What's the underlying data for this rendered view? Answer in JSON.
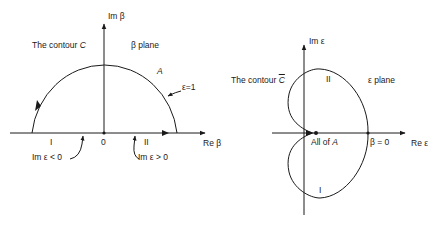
{
  "left_panel": {
    "im_axis_label": "Im β",
    "re_axis_label": "Re β",
    "contour_label_prefix": "The contour ",
    "contour_label_symbol": "C",
    "plane_label": "β plane",
    "arc_label": "A",
    "epsilon_label": "ε=1",
    "origin_label": "0",
    "region_I": "I",
    "region_II": "II",
    "im_eps_neg_label": "Im ε < 0",
    "im_eps_pos_label": "Im ε > 0"
  },
  "right_panel": {
    "im_axis_label": "Im ε",
    "re_axis_label": "Re ε",
    "contour_label_prefix": "The contour ",
    "contour_label_symbol": "C",
    "plane_label": "ε plane",
    "region_II": "II",
    "region_I": "I",
    "all_of_A_prefix": "All of ",
    "all_of_A_symbol": "A",
    "beta_zero_label": "β = 0"
  },
  "colors": {
    "ink": "#1a1a1a",
    "background": "#ffffff"
  }
}
